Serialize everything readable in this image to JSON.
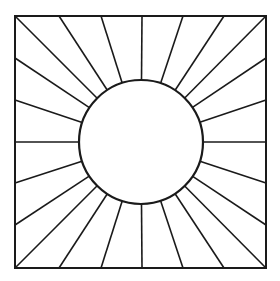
{
  "figure": {
    "width": 280,
    "height": 281,
    "stroke_color": "#1a1a1a",
    "background": "#ffffff",
    "square": {
      "x1": 15,
      "y1": 16,
      "x2": 266,
      "y2": 268,
      "stroke_width": 2
    },
    "circle": {
      "cx": 141,
      "cy": 142,
      "r": 62,
      "stroke_width": 2.2
    },
    "ray_stroke_width": 1.6,
    "ray_edge_points": [
      [
        15,
        16
      ],
      [
        59,
        16
      ],
      [
        101,
        16
      ],
      [
        142,
        16
      ],
      [
        183,
        16
      ],
      [
        224,
        16
      ],
      [
        266,
        16
      ],
      [
        266,
        58
      ],
      [
        266,
        100
      ],
      [
        266,
        142
      ],
      [
        266,
        183
      ],
      [
        266,
        225
      ],
      [
        266,
        268
      ],
      [
        224,
        268
      ],
      [
        183,
        268
      ],
      [
        142,
        268
      ],
      [
        101,
        268
      ],
      [
        59,
        268
      ],
      [
        15,
        268
      ],
      [
        15,
        225
      ],
      [
        15,
        183
      ],
      [
        15,
        142
      ],
      [
        15,
        100
      ],
      [
        15,
        58
      ]
    ]
  }
}
